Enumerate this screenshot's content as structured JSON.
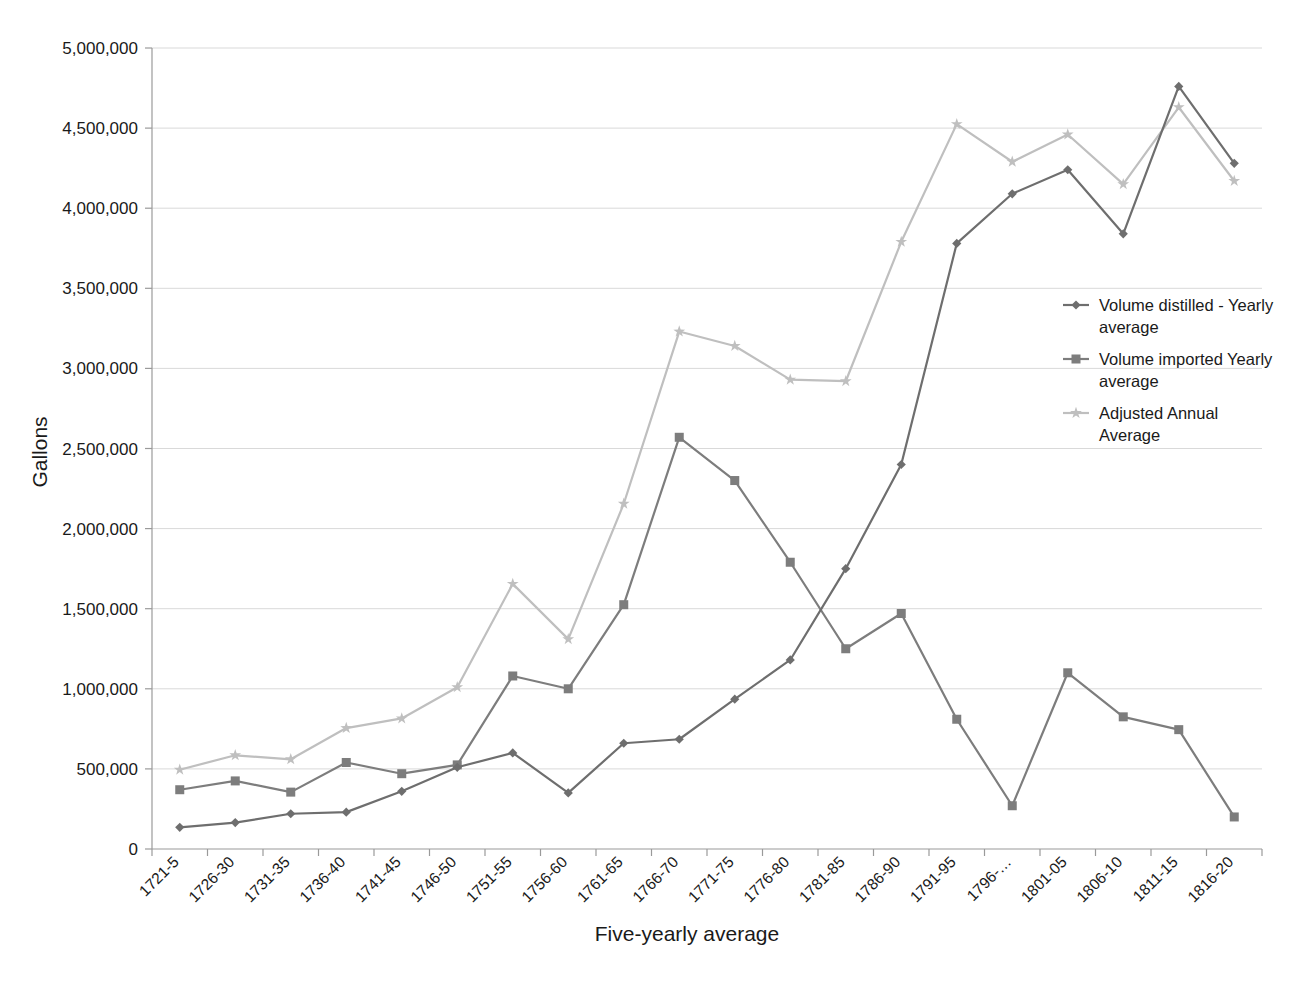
{
  "chart_data": {
    "type": "line",
    "title": "",
    "xlabel": "Five-yearly average",
    "ylabel": "Gallons",
    "ylim": [
      0,
      5000000
    ],
    "ytick_step": 500000,
    "grid": true,
    "legend_position": "right-middle",
    "ytick_labels": [
      "0",
      "500,000",
      "1,000,000",
      "1,500,000",
      "2,000,000",
      "2,500,000",
      "3,000,000",
      "3,500,000",
      "4,000,000",
      "4,500,000",
      "5,000,000"
    ],
    "ytick_values": [
      0,
      500000,
      1000000,
      1500000,
      2000000,
      2500000,
      3000000,
      3500000,
      4000000,
      4500000,
      5000000
    ],
    "categories": [
      "1721-5",
      "1726-30",
      "1731-35",
      "1736-40",
      "1741-45",
      "1746-50",
      "1751-55",
      "1756-60",
      "1761-65",
      "1766-70",
      "1771-75",
      "1776-80",
      "1781-85",
      "1786-90",
      "1791-95",
      "1796-…",
      "1801-05",
      "1806-10",
      "1811-15",
      "1816-20"
    ],
    "series": [
      {
        "name": "Volume distilled - Yearly average",
        "legend_label_line1": "Volume distilled - Yearly",
        "legend_label_line2": "average",
        "color": "#6e6e6e",
        "marker": "diamond",
        "values": [
          135000,
          165000,
          220000,
          230000,
          360000,
          510000,
          600000,
          350000,
          660000,
          685000,
          935000,
          1180000,
          1750000,
          2400000,
          3780000,
          4090000,
          4240000,
          3840000,
          4760000,
          4280000
        ]
      },
      {
        "name": "Volume imported Yearly average",
        "legend_label_line1": "Volume imported Yearly",
        "legend_label_line2": "average",
        "color": "#7d7d7d",
        "marker": "square",
        "values": [
          370000,
          425000,
          355000,
          540000,
          470000,
          525000,
          1080000,
          1000000,
          1525000,
          2570000,
          2300000,
          1790000,
          1250000,
          1470000,
          810000,
          270000,
          1100000,
          825000,
          745000,
          200000
        ]
      },
      {
        "name": "Adjusted Annual Average",
        "legend_label_line1": "Adjusted Annual",
        "legend_label_line2": "Average",
        "color": "#bfbfbf",
        "marker": "star",
        "values": [
          495000,
          585000,
          560000,
          755000,
          815000,
          1010000,
          1655000,
          1310000,
          2155000,
          3230000,
          3140000,
          2930000,
          2920000,
          3790000,
          4525000,
          4290000,
          4460000,
          4150000,
          4630000,
          4170000
        ]
      }
    ]
  },
  "accent_colors": {
    "grid": "#d9d9d9",
    "axis": "#9a9a9a",
    "text": "#1a1a1a",
    "background": "#ffffff"
  }
}
